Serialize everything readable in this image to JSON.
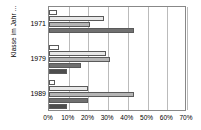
{
  "chart_data": {
    "type": "bar",
    "orientation": "horizontal",
    "title": "",
    "xlabel": "",
    "ylabel": "Klasse im Jahr ...",
    "categories": [
      "1971",
      "1979",
      "1989"
    ],
    "xticklabels": [
      "0%",
      "10%",
      "20%",
      "30%",
      "40%",
      "50%",
      "60%",
      "70%"
    ],
    "xtickvalues": [
      0,
      10,
      20,
      30,
      40,
      50,
      60,
      70
    ],
    "xlim": [
      0,
      70
    ],
    "grid": "vertical",
    "legend": "none",
    "series": [
      {
        "name": "Serie 1",
        "color": "#ffffff",
        "values": [
          4,
          5,
          3
        ]
      },
      {
        "name": "Serie 2",
        "color": "#e8e8e8",
        "values": [
          28,
          29,
          20
        ]
      },
      {
        "name": "Serie 3",
        "color": "#b5b5b5",
        "values": [
          21,
          31,
          43
        ]
      },
      {
        "name": "Serie 4",
        "color": "#707070",
        "values": [
          43,
          16,
          20
        ]
      },
      {
        "name": "Serie 5",
        "color": "#4d4d4d",
        "values": [
          0,
          9,
          9
        ]
      }
    ]
  },
  "axis": {
    "y_title": "Klasse im Jahr ..."
  }
}
